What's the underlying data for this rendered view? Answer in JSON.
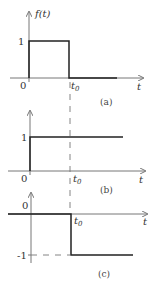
{
  "figure": {
    "colors": {
      "axis": "#777777",
      "signal": "#222222",
      "dashed": "#666666"
    },
    "plots": [
      {
        "id": "a",
        "caption": "(a)",
        "y_axis_label": "f(t)",
        "x_axis_label": "t",
        "origin_label": "0",
        "t0_label": "t",
        "t0_sub": "0",
        "level_label": "1",
        "description": "Rectangular pulse of height 1 from t=0 to t=t0"
      },
      {
        "id": "b",
        "caption": "(b)",
        "x_axis_label": "t",
        "origin_label": "0",
        "t0_label": "t",
        "t0_sub": "0",
        "level_label": "1",
        "description": "Unit step starting at t=0"
      },
      {
        "id": "c",
        "caption": "(c)",
        "x_axis_label": "t",
        "origin_label": "0",
        "t0_label": "t",
        "t0_sub": "0",
        "level_label": "-1",
        "description": "Negative unit step starting at t=t0"
      }
    ]
  }
}
